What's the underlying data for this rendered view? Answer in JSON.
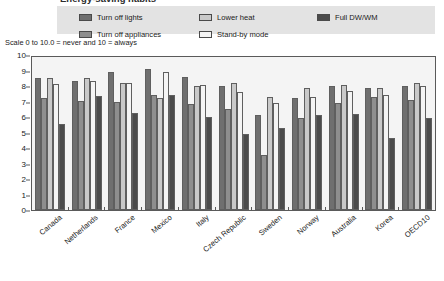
{
  "title": "Energy-saving habits",
  "subtitle": "Scale 0 to 10.0 = never and 10 = always",
  "legend": {
    "items": [
      {
        "label": "Turn off lights",
        "color": "#6f6f6f"
      },
      {
        "label": "Turn off appliances",
        "color": "#8e8e8e"
      },
      {
        "label": "Lower heat",
        "color": "#c9c9c9"
      },
      {
        "label": "Stand-by mode",
        "color": "#f4f4f4"
      },
      {
        "label": "Full DW/WM",
        "color": "#4b4b4b"
      }
    ],
    "background": "#e3e3e3"
  },
  "chart_data": {
    "type": "bar",
    "title": "Energy-saving habits",
    "subtitle": "Scale 0 to 10.0 = never and 10 = always",
    "xlabel": "",
    "ylabel": "",
    "ylim": [
      0,
      10
    ],
    "ytick_values": [
      0,
      1,
      2,
      3,
      4,
      5,
      6,
      7,
      8,
      9,
      10
    ],
    "grid": false,
    "legend_position": "top",
    "categories": [
      "Canada",
      "Netherlands",
      "France",
      "Mexico",
      "Italy",
      "Czech Republic",
      "Sweden",
      "Norway",
      "Australia",
      "Korea",
      "OECD10"
    ],
    "series": [
      {
        "name": "Turn off lights",
        "color": "#6f6f6f",
        "values": [
          8.6,
          8.4,
          9.0,
          9.2,
          8.7,
          8.1,
          6.2,
          7.3,
          8.1,
          8.0,
          8.1
        ]
      },
      {
        "name": "Turn off appliances",
        "color": "#8e8e8e",
        "values": [
          7.3,
          7.1,
          7.05,
          7.5,
          6.95,
          6.6,
          3.6,
          6.0,
          7.0,
          7.4,
          7.2
        ]
      },
      {
        "name": "Lower heat",
        "color": "#c9c9c9",
        "values": [
          8.6,
          8.65,
          8.3,
          7.3,
          8.1,
          8.3,
          7.4,
          8.0,
          8.2,
          8.0,
          8.3
        ]
      },
      {
        "name": "Stand-by mode",
        "color": "#f4f4f4",
        "values": [
          8.25,
          8.4,
          8.3,
          9.0,
          8.2,
          7.7,
          7.0,
          7.4,
          7.8,
          7.5,
          8.1
        ]
      },
      {
        "name": "Full DW/WM",
        "color": "#4b4b4b",
        "values": [
          5.6,
          7.45,
          6.35,
          7.55,
          6.1,
          5.0,
          5.35,
          6.2,
          6.3,
          4.7,
          6.0
        ]
      }
    ]
  }
}
